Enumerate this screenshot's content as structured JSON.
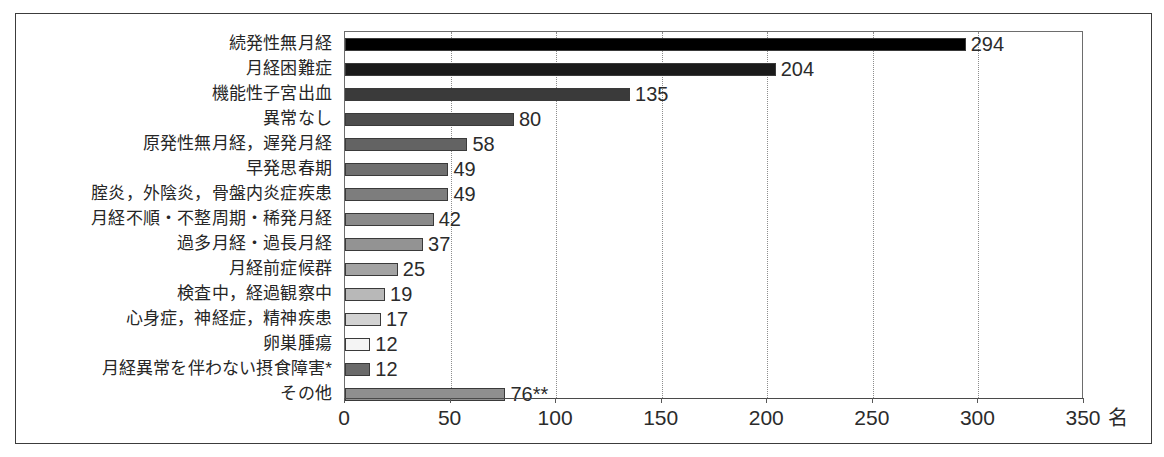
{
  "chart_data": {
    "type": "bar",
    "orientation": "horizontal",
    "title": "",
    "xlabel": "名",
    "ylabel": "",
    "xlim": [
      0,
      350
    ],
    "xticks": [
      0,
      50,
      100,
      150,
      200,
      250,
      300,
      350
    ],
    "xtick_labels": [
      "0",
      "50",
      "100",
      "150",
      "200",
      "250",
      "300",
      "350"
    ],
    "grid": "vertical dotted gridlines at every 50 units",
    "legend": "none",
    "unit_suffix": "名",
    "categories": [
      "続発性無月経",
      "月経困難症",
      "機能性子宮出血",
      "異常なし",
      "原発性無月経，遅発月経",
      "早発思春期",
      "腟炎，外陰炎，骨盤内炎症疾患",
      "月経不順・不整周期・稀発月経",
      "過多月経・過長月経",
      "月経前症候群",
      "検査中，経過観察中",
      "心身症，神経症，精神疾患",
      "卵巣腫瘍",
      "月経異常を伴わない摂食障害*",
      "その他"
    ],
    "values": [
      294,
      204,
      135,
      80,
      58,
      49,
      49,
      42,
      37,
      25,
      19,
      17,
      12,
      12,
      76
    ],
    "value_labels": [
      "294",
      "204",
      "135",
      "80",
      "58",
      "49",
      "49",
      "42",
      "37",
      "25",
      "19",
      "17",
      "12",
      "12",
      "76**"
    ],
    "bar_colors": [
      "#000000",
      "#1a1a1a",
      "#3a3a3a",
      "#4d4d4d",
      "#636363",
      "#6f6f6f",
      "#7d7d7d",
      "#8a8a8a",
      "#939393",
      "#a3a3a3",
      "#b8b8b8",
      "#d2d2d2",
      "#f4f4f4",
      "#6a6a6a",
      "#8f8f8f"
    ]
  }
}
